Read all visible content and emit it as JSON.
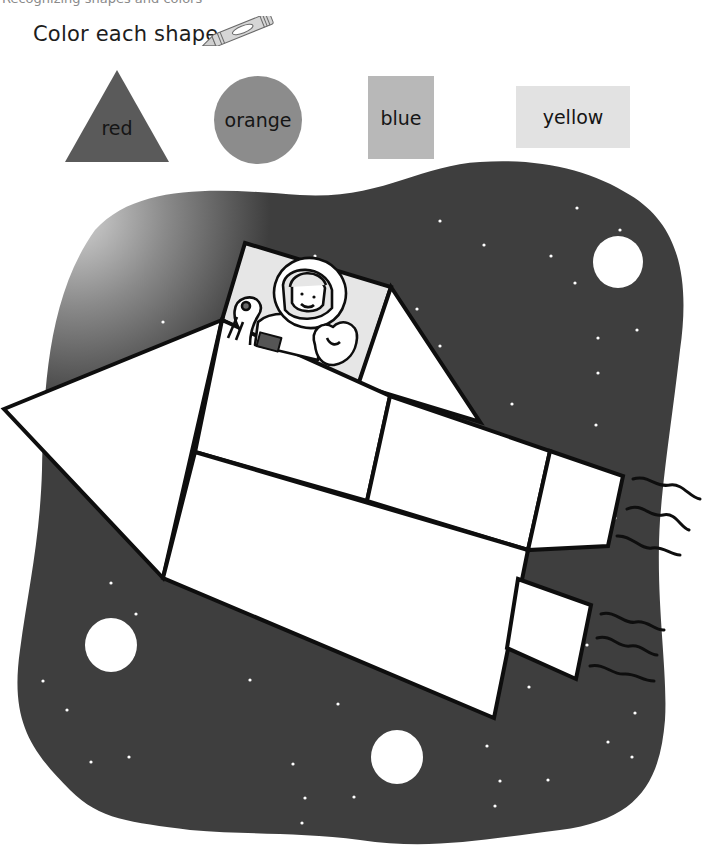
{
  "header": {
    "cut_off_text": "Recognizing shapes and colors",
    "instruction": "Color each shape."
  },
  "icons": {
    "crayon": "crayon-icon"
  },
  "legend": [
    {
      "shape": "triangle",
      "label": "red",
      "fill": "#5a5a5a"
    },
    {
      "shape": "circle",
      "label": "orange",
      "fill": "#8c8c8c"
    },
    {
      "shape": "square",
      "label": "blue",
      "fill": "#b8b8b8"
    },
    {
      "shape": "rectangle",
      "label": "yellow",
      "fill": "#e2e2e2"
    }
  ],
  "scene": {
    "background_color": "#3e3e3e",
    "glow_color": "#c9c9c9",
    "outline_color": "#0e0e0e",
    "shape_fill": "#ffffff",
    "description": "Rocket ship made of shapes flying through space with astronaut in window"
  }
}
